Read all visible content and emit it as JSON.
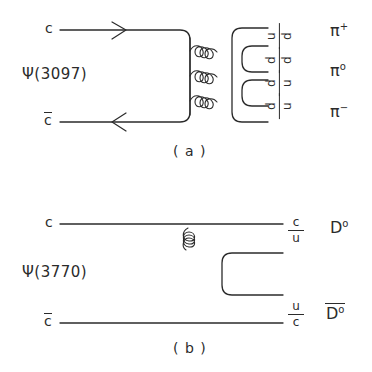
{
  "figure": {
    "background": "#ffffff",
    "line_color": "#2b2b2b",
    "width": 372,
    "height": 372
  },
  "diagram_a": {
    "caption": "( a )",
    "resonance": "Ψ(3097)",
    "incoming": {
      "top_quark": "c",
      "bottom_quark": "c",
      "bottom_is_antiquark": true
    },
    "gluon_count": 3,
    "gluon_orientation": "horizontal",
    "outgoing_pairs": [
      {
        "top": "u",
        "bottom": "d",
        "bottom_bar": true
      },
      {
        "top": "d",
        "bottom": "d",
        "bottom_bar": true
      },
      {
        "top": "d",
        "bottom": "u",
        "bottom_bar": true
      }
    ],
    "products": [
      {
        "symbol": "π",
        "charge": "+"
      },
      {
        "symbol": "π",
        "charge": "o"
      },
      {
        "symbol": "π",
        "charge": "−"
      }
    ]
  },
  "diagram_b": {
    "caption": "( b )",
    "resonance": "Ψ(3770)",
    "incoming": {
      "top_quark": "c",
      "bottom_quark": "c",
      "bottom_is_antiquark": true
    },
    "gluon_count": 1,
    "gluon_orientation": "diagonal",
    "outgoing_pairs": [
      {
        "top": "c",
        "bottom": "u",
        "bottom_bar": true
      },
      {
        "top": "u",
        "bottom": "c",
        "bottom_bar": true
      }
    ],
    "products": [
      {
        "symbol": "D",
        "charge": "o",
        "bar": false
      },
      {
        "symbol": "D",
        "charge": "o",
        "bar": true
      }
    ]
  }
}
